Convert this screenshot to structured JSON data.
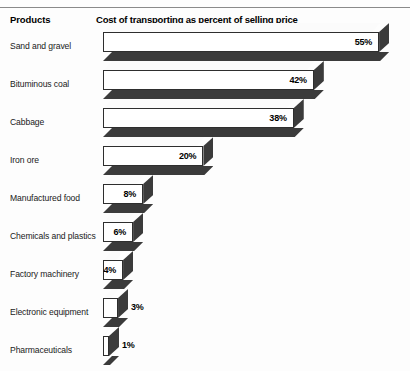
{
  "header": {
    "products_label": "Products",
    "title": "Cost of transporting as percent of selling price"
  },
  "colors": {
    "background": "#fdfdfd",
    "bar_face": "#ffffff",
    "bar_shadow": "#3b3b3b",
    "bar_outline": "#2e2e2e",
    "text": "#000000",
    "rule": "#8a8a8a"
  },
  "chart_data": {
    "type": "bar",
    "orientation": "horizontal",
    "style": "3d",
    "title": "Cost of transporting as percent of selling price",
    "xlabel": "",
    "ylabel": "Products",
    "xlim": [
      0,
      60
    ],
    "grid": false,
    "legend": false,
    "unit": "%",
    "categories": [
      "Sand and gravel",
      "Bituminous coal",
      "Cabbage",
      "Iron ore",
      "Manufactured food",
      "Chemicals and plastics",
      "Factory machinery",
      "Electronic equipment",
      "Pharmaceuticals"
    ],
    "values": [
      55,
      42,
      38,
      20,
      8,
      6,
      4,
      3,
      1
    ],
    "data_labels": [
      "55%",
      "42%",
      "38%",
      "20%",
      "8%",
      "6%",
      "4%",
      "3%",
      "1%"
    ],
    "label_placement": [
      "inside",
      "inside",
      "inside",
      "inside",
      "inside",
      "inside",
      "inside",
      "outside",
      "outside"
    ]
  },
  "rows": [
    {
      "label": "Sand and gravel",
      "value": 55,
      "display": "55%",
      "placement": "inside"
    },
    {
      "label": "Bituminous coal",
      "value": 42,
      "display": "42%",
      "placement": "inside"
    },
    {
      "label": "Cabbage",
      "value": 38,
      "display": "38%",
      "placement": "inside"
    },
    {
      "label": "Iron ore",
      "value": 20,
      "display": "20%",
      "placement": "inside"
    },
    {
      "label": "Manufactured food",
      "value": 8,
      "display": "8%",
      "placement": "inside"
    },
    {
      "label": "Chemicals and plastics",
      "value": 6,
      "display": "6%",
      "placement": "inside"
    },
    {
      "label": "Factory machinery",
      "value": 4,
      "display": "4%",
      "placement": "inside"
    },
    {
      "label": "Electronic equipment",
      "value": 3,
      "display": "3%",
      "placement": "outside"
    },
    {
      "label": "Pharmaceuticals",
      "value": 1,
      "display": "1%",
      "placement": "outside"
    }
  ]
}
